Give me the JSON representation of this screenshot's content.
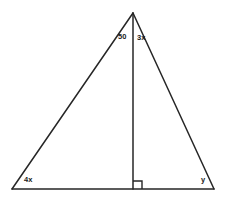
{
  "figure": {
    "background_color": "#ffffff",
    "stroke_color": "#262626",
    "text_color": "#1a1a1a",
    "width": 227,
    "height": 202
  },
  "geometry": {
    "apex": {
      "x": 133,
      "y": 13
    },
    "base_left": {
      "x": 12,
      "y": 189
    },
    "base_right": {
      "x": 214,
      "y": 189
    },
    "altitude_foot": {
      "x": 133,
      "y": 189
    },
    "right_angle_marker": {
      "x": 133,
      "y": 181,
      "size": 9
    }
  },
  "labels": {
    "apex_left": "50",
    "apex_right": "3x",
    "base_left": "4x",
    "base_right": "y"
  }
}
